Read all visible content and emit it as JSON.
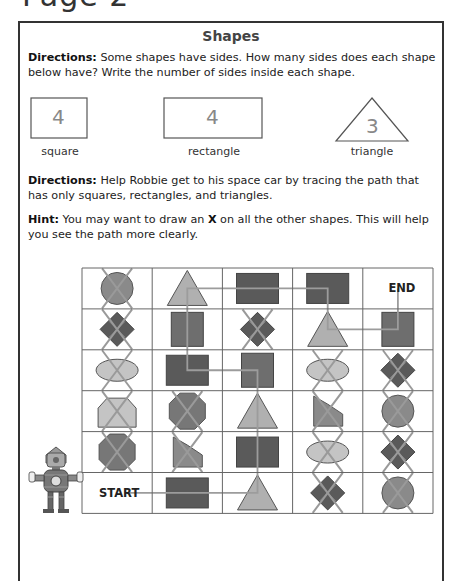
{
  "page": {
    "header_partial": "Page 2"
  },
  "worksheet": {
    "title": "Shapes",
    "directions_1": {
      "label": "Directions:",
      "text": " Some shapes have sides. How many sides does each shape below have? Write the number of sides inside each shape."
    },
    "examples": [
      {
        "shape": "square",
        "label": "square",
        "sides": "4"
      },
      {
        "shape": "rectangle",
        "label": "rectangle",
        "sides": "4"
      },
      {
        "shape": "triangle",
        "label": "triangle",
        "sides": "3"
      }
    ],
    "directions_2": {
      "label": "Directions:",
      "text": " Help Robbie get to his space car by tracing the path that has only squares, rectangles, and triangles."
    },
    "hint": {
      "label": "Hint:",
      "text_before": " You may want to draw an ",
      "x_mark": "X",
      "text_after": " on all the other shapes. This will help you see the path more clearly."
    },
    "maze": {
      "start_label": "START",
      "end_label": "END",
      "rows": [
        [
          "circle-x",
          "triangle",
          "rectangle",
          "rectangle",
          "end"
        ],
        [
          "diamond-x",
          "square",
          "diamond-x",
          "triangle",
          "square"
        ],
        [
          "ellipse-x",
          "rectangle",
          "square",
          "ellipse-x",
          "diamond-x"
        ],
        [
          "pentagon-x",
          "octagon-x",
          "triangle",
          "trapezoid-x",
          "circle-x"
        ],
        [
          "octagon-x",
          "trapezoid-x",
          "rectangle",
          "ellipse-x",
          "diamond-x"
        ],
        [
          "start",
          "rectangle",
          "triangle",
          "diamond-x",
          "circle-x"
        ]
      ],
      "path": [
        [
          5,
          0
        ],
        [
          5,
          1
        ],
        [
          5,
          2
        ],
        [
          4,
          2
        ],
        [
          3,
          2
        ],
        [
          2,
          2
        ],
        [
          2,
          1
        ],
        [
          1,
          1
        ],
        [
          0,
          1
        ],
        [
          0,
          2
        ],
        [
          0,
          3
        ],
        [
          1,
          3
        ],
        [
          1,
          4
        ],
        [
          0,
          4
        ]
      ]
    },
    "character": {
      "name": "Robbie",
      "icon": "robot-icon"
    },
    "colors": {
      "dark_fill": "#5a5a5a",
      "mid_fill": "#8a8a8a",
      "light_fill": "#c4c4c4",
      "x_line": "#9a9a9a",
      "path_line": "#9c9c9c",
      "grid_line": "#666666"
    }
  }
}
